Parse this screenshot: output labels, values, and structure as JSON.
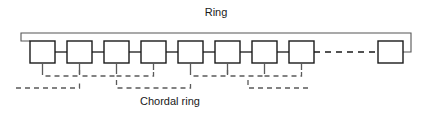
{
  "figure": {
    "title_label": "Ring",
    "chord_label": "Chordal ring",
    "canvas": {
      "width": 432,
      "height": 113
    },
    "colors": {
      "background": "#ffffff",
      "node_stroke": "#1a1a1a",
      "ring_stroke": "#555555",
      "chord_stroke": "#5a5a5a",
      "text": "#1a1a1a"
    }
  },
  "diagram_data": {
    "type": "diagram",
    "topology": "chordal ring",
    "node_count_drawn": 9,
    "nodes": [
      {
        "id": "n1",
        "x": 30,
        "y": 41,
        "w": 25,
        "h": 22
      },
      {
        "id": "n2",
        "x": 67,
        "y": 41,
        "w": 25,
        "h": 22
      },
      {
        "id": "n3",
        "x": 104,
        "y": 41,
        "w": 25,
        "h": 22
      },
      {
        "id": "n4",
        "x": 141,
        "y": 41,
        "w": 25,
        "h": 22
      },
      {
        "id": "n5",
        "x": 178,
        "y": 41,
        "w": 25,
        "h": 22
      },
      {
        "id": "n6",
        "x": 215,
        "y": 41,
        "w": 25,
        "h": 22
      },
      {
        "id": "n7",
        "x": 252,
        "y": 41,
        "w": 25,
        "h": 22
      },
      {
        "id": "n8",
        "x": 289,
        "y": 41,
        "w": 25,
        "h": 22
      },
      {
        "id": "n9",
        "x": 378,
        "y": 41,
        "w": 25,
        "h": 22
      }
    ],
    "ring_links": [
      {
        "from": "n1",
        "to": "n2",
        "style": "solid"
      },
      {
        "from": "n2",
        "to": "n3",
        "style": "solid"
      },
      {
        "from": "n3",
        "to": "n4",
        "style": "solid"
      },
      {
        "from": "n4",
        "to": "n5",
        "style": "solid"
      },
      {
        "from": "n5",
        "to": "n6",
        "style": "solid"
      },
      {
        "from": "n6",
        "to": "n7",
        "style": "solid"
      },
      {
        "from": "n7",
        "to": "n8",
        "style": "solid"
      },
      {
        "from": "n8",
        "to": "n9",
        "style": "dashed"
      }
    ],
    "ring_closure": {
      "description": "wrap-around line from last node back to first node over the top",
      "top_y": 33,
      "left_x": 21,
      "right_x": 411
    },
    "chords": [
      {
        "id": "c1",
        "from": "n1",
        "to": "n2",
        "row": "upper"
      },
      {
        "id": "c2",
        "from": "n2",
        "to": "n3",
        "row": "upper"
      },
      {
        "id": "c3",
        "from": "n3",
        "to": "n4",
        "row": "upper"
      },
      {
        "id": "c4",
        "from": "n5",
        "to": "n6",
        "row": "upper"
      },
      {
        "id": "c5",
        "from": "n6",
        "to": "n7",
        "row": "upper"
      },
      {
        "id": "c6",
        "from": "n7",
        "to": "n8",
        "row": "upper"
      },
      {
        "id": "c7",
        "from": "left-edge",
        "to": "n2",
        "row": "lower"
      },
      {
        "id": "c8",
        "from": "n3",
        "to": "n6",
        "row": "lower"
      },
      {
        "id": "c9",
        "from": "n7",
        "to": "right-span",
        "row": "lower"
      }
    ],
    "annotations": [
      {
        "text": "Ring",
        "x": 216,
        "y": 12
      },
      {
        "text": "Chordal ring",
        "x": 170,
        "y": 101
      }
    ]
  }
}
